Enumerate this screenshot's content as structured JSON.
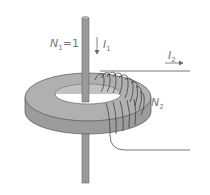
{
  "diagram": {
    "labels": {
      "primary_turns": "N",
      "primary_turns_sub": "1",
      "primary_turns_value": "=1",
      "primary_current": "I",
      "primary_current_sub": "1",
      "secondary_current": "I",
      "secondary_current_sub": "2",
      "secondary_turns": "N",
      "secondary_turns_sub": "2"
    },
    "colors": {
      "core": "#a8a8a8",
      "core_dark": "#8c8c8c",
      "rod": "#9a9a9a",
      "wire": "#444444",
      "label": "#777777"
    }
  }
}
